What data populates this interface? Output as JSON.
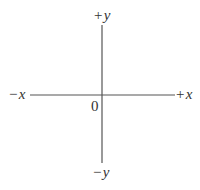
{
  "diagram": {
    "axes": {
      "positive_y": {
        "sign": "+",
        "var": "y"
      },
      "negative_y": {
        "sign": "−",
        "var": "y"
      },
      "positive_x": {
        "sign": "+",
        "var": "x"
      },
      "negative_x": {
        "sign": "−",
        "var": "x"
      }
    },
    "origin_label": "0",
    "line_color": "#555555"
  }
}
